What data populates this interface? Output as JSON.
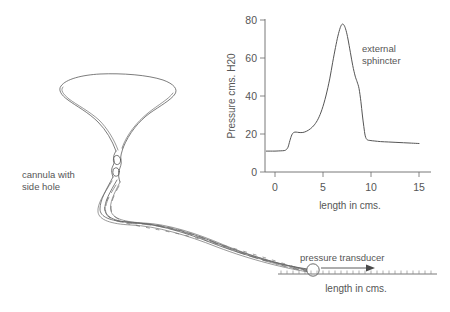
{
  "figure": {
    "name": "urethral-pressure-profile-diagram",
    "background_color": "#ffffff",
    "ink_color": "#555555"
  },
  "diagram": {
    "bladder_label": "bladder",
    "cannula_label_line1": "cannula with",
    "cannula_label_line2": "side hole",
    "transducer_label": "pressure transducer",
    "baseline_axis_label": "length in cms."
  },
  "chart_data": {
    "type": "line",
    "title": "",
    "xlabel": "length in cms.",
    "ylabel": "Pressure cms. H20",
    "xlim": [
      -1,
      15
    ],
    "ylim": [
      0,
      80
    ],
    "xticks": [
      0,
      5,
      10,
      15
    ],
    "xtick_labels": [
      "0",
      "5",
      "10",
      "15"
    ],
    "yticks": [
      0,
      20,
      40,
      60,
      80
    ],
    "ytick_labels": [
      "0",
      "20",
      "40",
      "60",
      "80"
    ],
    "grid": false,
    "legend": "none",
    "annotations": [
      {
        "text_line1": "external",
        "text_line2": "sphincter",
        "x": 8.9,
        "y": 62
      }
    ],
    "series": [
      {
        "name": "urethral pressure profile",
        "x": [
          -0.9,
          -0.5,
          0.0,
          0.4,
          0.8,
          1.1,
          1.35,
          1.55,
          1.75,
          1.95,
          2.2,
          2.5,
          2.9,
          3.3,
          3.7,
          4.1,
          4.5,
          4.9,
          5.3,
          5.7,
          6.0,
          6.3,
          6.55,
          6.8,
          7.0,
          7.2,
          7.4,
          7.6,
          7.85,
          8.1,
          8.35,
          8.55,
          8.75,
          8.95,
          9.1,
          9.25,
          9.4,
          9.6,
          9.9,
          10.4,
          11.0,
          11.8,
          12.6,
          13.4,
          14.2,
          15.0
        ],
        "y": [
          11.0,
          11.0,
          11.0,
          11.1,
          11.2,
          11.5,
          13.0,
          16.5,
          19.5,
          20.8,
          21.0,
          20.8,
          20.8,
          21.5,
          22.8,
          24.8,
          28.0,
          33.0,
          40.0,
          49.0,
          57.5,
          65.5,
          71.5,
          76.0,
          77.8,
          77.2,
          74.5,
          70.0,
          63.0,
          56.0,
          50.5,
          47.5,
          44.0,
          37.0,
          30.0,
          24.0,
          19.0,
          17.0,
          16.6,
          16.3,
          16.0,
          15.8,
          15.6,
          15.4,
          15.2,
          15.0
        ]
      }
    ]
  }
}
